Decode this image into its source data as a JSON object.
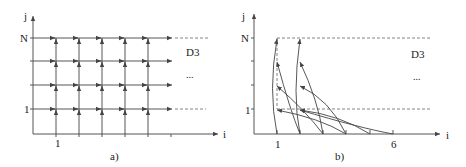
{
  "panel_a": {
    "caption": "a)",
    "y_axis_label": "j",
    "x_axis_label": "i",
    "y_tick_top": "N",
    "y_tick_bottom": "1",
    "x_tick_first": "1",
    "region_label": "D3",
    "ellipsis": "..."
  },
  "panel_b": {
    "caption": "b)",
    "y_axis_label": "j",
    "x_axis_label": "i",
    "y_tick_top": "N",
    "y_tick_bottom": "1",
    "x_tick_first": "1",
    "x_tick_last": "6",
    "region_label": "D3",
    "ellipsis": "..."
  }
}
